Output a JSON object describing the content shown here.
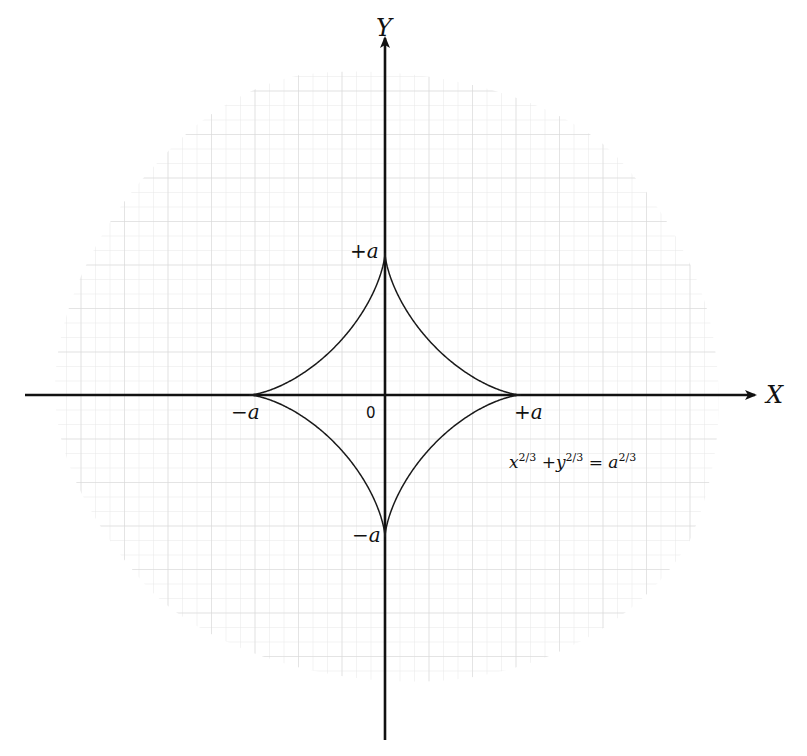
{
  "figure": {
    "type": "astroid",
    "axes": {
      "x_label": "X",
      "y_label": "Y"
    },
    "ticks": {
      "x_positive": "+a",
      "x_negative": "−a",
      "y_positive": "+a",
      "y_negative": "−a",
      "origin": "0"
    },
    "equation": {
      "x": "x",
      "x_exp": "2/3",
      "plus": "+",
      "y": "y",
      "y_exp": "2/3",
      "eq": "=",
      "a": "a",
      "a_exp": "2/3"
    },
    "colors": {
      "curve": "#1a1a1a",
      "axes": "#111111",
      "grid_minor": "#e6e6e6",
      "grid_major": "#d2d2d2",
      "background": "#ffffff"
    },
    "geometry": {
      "origin_px": [
        385,
        395
      ],
      "a_x_px": 136,
      "a_y_px": 142,
      "grid_minor_px": 14.5
    }
  }
}
